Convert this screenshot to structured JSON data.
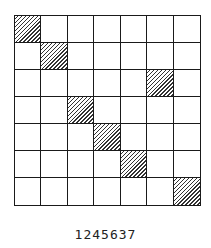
{
  "diagram": {
    "type": "permutation-matrix-grid",
    "rows": 7,
    "cols": 7,
    "hatched_cells": [
      {
        "row": 0,
        "col": 0
      },
      {
        "row": 1,
        "col": 1
      },
      {
        "row": 2,
        "col": 5
      },
      {
        "row": 3,
        "col": 2
      },
      {
        "row": 4,
        "col": 3
      },
      {
        "row": 5,
        "col": 4
      },
      {
        "row": 6,
        "col": 6
      }
    ],
    "caption": "1245637",
    "colors": {
      "line": "#1a1a1a",
      "hatch": "#333333",
      "background": "#ffffff"
    }
  }
}
